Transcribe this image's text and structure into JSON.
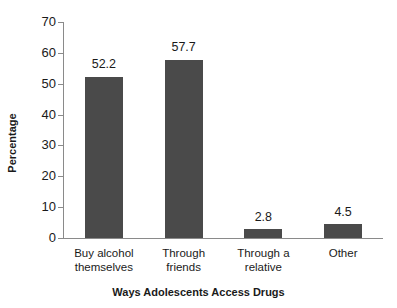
{
  "chart_data": {
    "type": "bar",
    "title": "",
    "categories": [
      "Buy alcohol themselves",
      "Through friends",
      "Through a relative",
      "Other"
    ],
    "category_lines": [
      [
        "Buy alcohol",
        "themselves"
      ],
      [
        "Through",
        "friends"
      ],
      [
        "Through a",
        "relative"
      ],
      [
        "Other"
      ]
    ],
    "values": [
      52.2,
      57.7,
      2.8,
      4.5
    ],
    "value_labels": [
      "52.2",
      "57.7",
      "2.8",
      "4.5"
    ],
    "xlabel": "Ways Adolescents Access Drugs",
    "ylabel": "Percentage",
    "ylim": [
      0,
      70
    ],
    "ytick_step": 10,
    "ytick_labels": [
      "70",
      "60",
      "50",
      "40",
      "30",
      "20",
      "10",
      "0"
    ],
    "grid": false,
    "legend": "none",
    "bar_color": "#4a4a4a",
    "axis_color": "#8a8a8a",
    "text_color": "#1a1a1a",
    "background": "#ffffff"
  }
}
